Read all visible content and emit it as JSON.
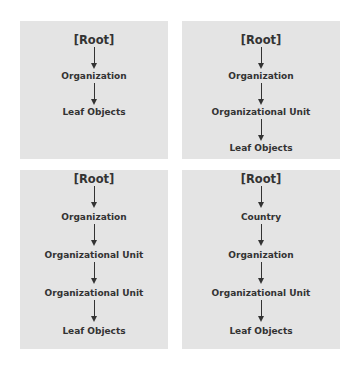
{
  "diagrams": [
    {
      "nodes": [
        "[Root]",
        "Organization",
        "Leaf Objects"
      ]
    },
    {
      "nodes": [
        "[Root]",
        "Organization",
        "Organizational Unit",
        "Leaf Objects"
      ]
    },
    {
      "nodes": [
        "[Root]",
        "Organization",
        "Organizational Unit",
        "Organizational Unit",
        "Leaf Objects"
      ]
    },
    {
      "nodes": [
        "[Root]",
        "Country",
        "Organization",
        "Organizational Unit",
        "Leaf Objects"
      ]
    }
  ],
  "colors": {
    "panel_bg": "#e4e4e4",
    "text": "#333333",
    "arrow": "#333333"
  }
}
